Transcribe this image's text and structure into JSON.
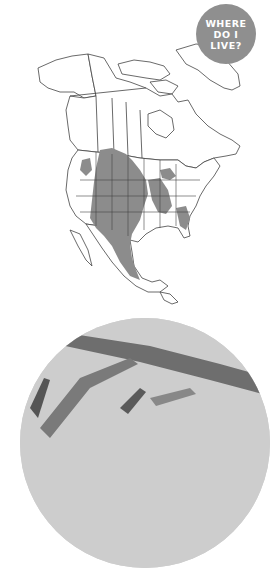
{
  "badge": {
    "lines": [
      "WHERE",
      "DO I",
      "LIVE?"
    ],
    "color": "#8f8f8f"
  },
  "map": {
    "region": "North America",
    "range_fill_color": "#8c8c8c",
    "outline_color": "#444444",
    "range_description": "Shaded range covering central/western United States plains, southern prairie Canada, Texas, northern and central Mexico, plus patches in the southeastern and Great Lakes states"
  },
  "photo": {
    "description": "Grayscale circular close-up photo of grass blades and stems"
  }
}
